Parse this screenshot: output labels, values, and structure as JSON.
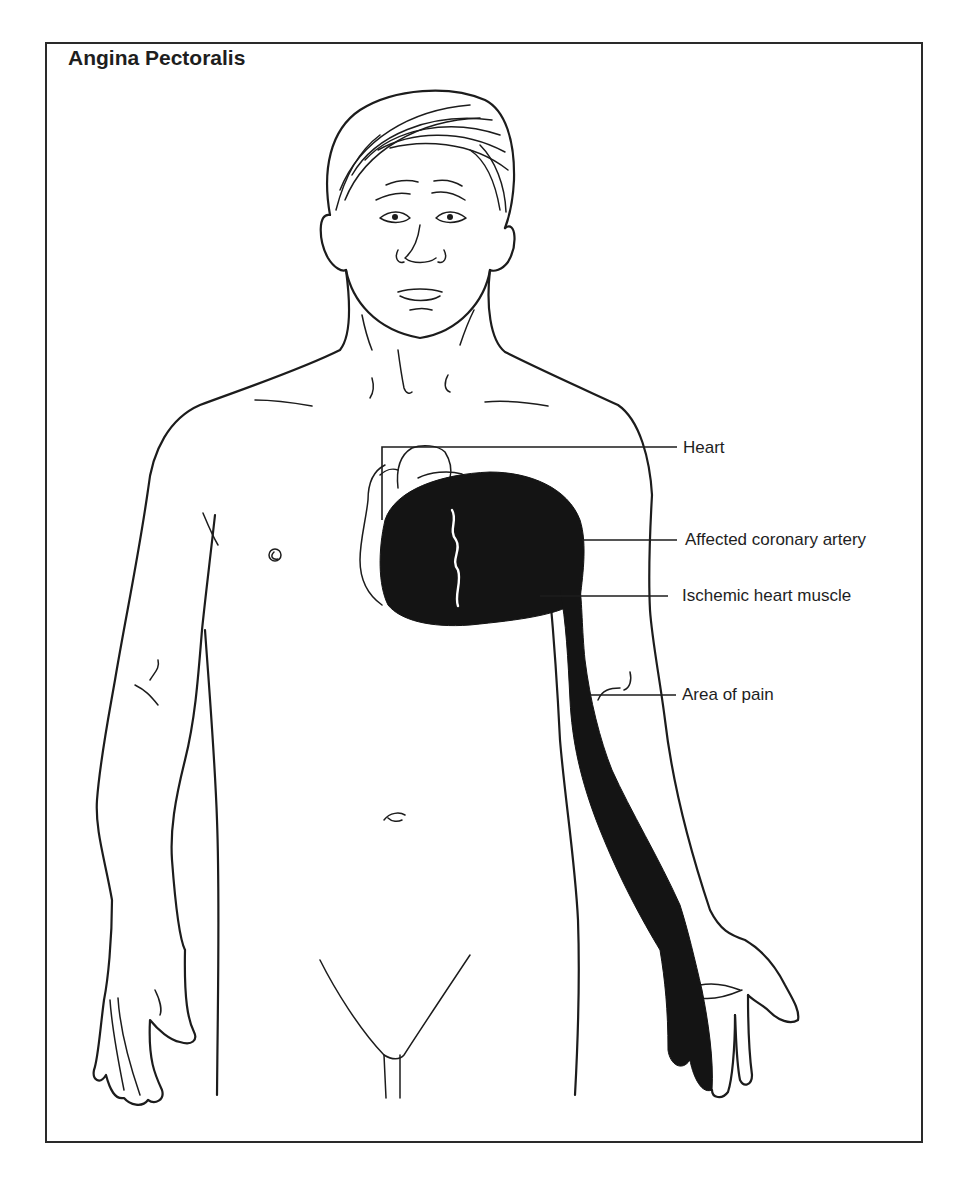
{
  "figure": {
    "title": "Angina Pectoralis",
    "labels": [
      {
        "id": "heart",
        "text": "Heart"
      },
      {
        "id": "affected-coronary-artery",
        "text": "Affected coronary artery"
      },
      {
        "id": "ischemic-heart-muscle",
        "text": "Ischemic heart muscle"
      },
      {
        "id": "area-of-pain",
        "text": "Area of pain"
      }
    ],
    "colors": {
      "ink": "#1c1c1c",
      "shaded_area": "#141414",
      "background": "#ffffff"
    }
  }
}
